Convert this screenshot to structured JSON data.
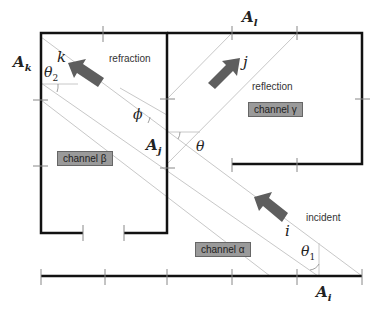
{
  "points": {
    "A_k": "A",
    "A_k_sub": "k",
    "A_l": "A",
    "A_l_sub": "l",
    "A_j": "A",
    "A_j_sub": "j",
    "A_i": "A",
    "A_i_sub": "i"
  },
  "waves": {
    "k": "k",
    "j": "j",
    "i": "i"
  },
  "labels": {
    "refraction": "refraction",
    "reflection": "reflection",
    "incident": "incident"
  },
  "angles": {
    "theta2": "θ",
    "theta2_sub": "2",
    "phi": "ϕ",
    "theta": "θ",
    "theta1": "θ",
    "theta1_sub": "1"
  },
  "channels": {
    "alpha": "channel α",
    "beta": "channel β",
    "gamma": "channel γ"
  },
  "colors": {
    "wall": "#111111",
    "ray": "#c8c8c8",
    "arrow": "#5e5e5e",
    "channel_box": "#9a9a9a"
  }
}
